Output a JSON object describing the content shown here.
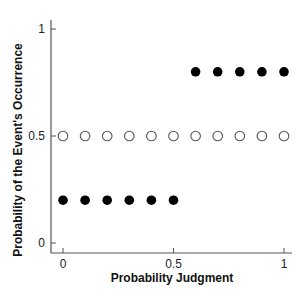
{
  "chart_data": {
    "type": "scatter",
    "title": "",
    "xlabel": "Probability Judgment",
    "ylabel": "Probability of the Event's Occurrence",
    "xlim": [
      0,
      1
    ],
    "ylim": [
      0,
      1
    ],
    "xticks": [
      0,
      0.5,
      1
    ],
    "xtick_labels": [
      "0",
      "0.5",
      "1"
    ],
    "yticks": [
      0,
      0.5,
      1
    ],
    "ytick_labels": [
      "0",
      "0.5",
      "1"
    ],
    "grid": false,
    "legend": null,
    "series": [
      {
        "name": "filled",
        "marker": "filled-circle",
        "color": "#000000",
        "x": [
          0,
          0.1,
          0.2,
          0.3,
          0.4,
          0.5,
          0.6,
          0.7,
          0.8,
          0.9,
          1.0
        ],
        "y": [
          0.2,
          0.2,
          0.2,
          0.2,
          0.2,
          0.2,
          0.8,
          0.8,
          0.8,
          0.8,
          0.8
        ]
      },
      {
        "name": "open",
        "marker": "open-circle",
        "color": "#555555",
        "x": [
          0,
          0.1,
          0.2,
          0.3,
          0.4,
          0.5,
          0.6,
          0.7,
          0.8,
          0.9,
          1.0
        ],
        "y": [
          0.5,
          0.5,
          0.5,
          0.5,
          0.5,
          0.5,
          0.5,
          0.5,
          0.5,
          0.5,
          0.5
        ]
      }
    ]
  }
}
